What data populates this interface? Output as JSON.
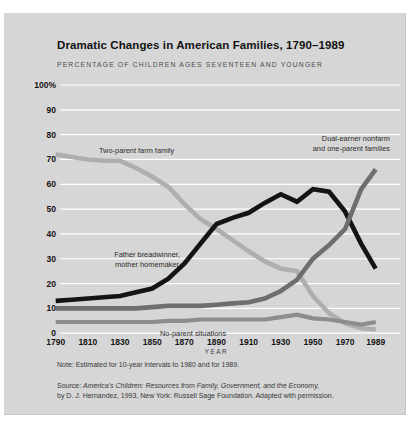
{
  "page": {
    "title": "Dramatic Changes in American Families, 1790–1989",
    "subtitle": "PERCENTAGE OF CHILDREN AGES SEVENTEEN AND YOUNGER",
    "note": "Note: Estimated for 10-year intervals to 1980 and for 1989.",
    "source_prefix": "Source: ",
    "source_italic": "America's Children: Resources from Family, Government, and the Economy,",
    "source_line2": "by D. J. Hernandez, 1993, New York: Russell Sage Foundation. Adapted with permission."
  },
  "colors": {
    "card_background": "#d6d6d6",
    "gridline": "#ffffff",
    "text": "#141414"
  },
  "chart_data": {
    "type": "line",
    "title": "Dramatic Changes in American Families, 1790–1989",
    "subtitle": "PERCENTAGE OF CHILDREN AGES SEVENTEEN AND YOUNGER",
    "xlabel": "YEAR",
    "ylabel": "",
    "ylim": [
      0,
      100
    ],
    "xlim": [
      1790,
      1989
    ],
    "grid": "horizontal-white-every-10",
    "legend_position": "in-plot-annotations",
    "y_tick_labels": [
      "100%",
      "90",
      "80",
      "70",
      "60",
      "50",
      "40",
      "30",
      "20",
      "10",
      "0"
    ],
    "y_tick_values": [
      100,
      90,
      80,
      70,
      60,
      50,
      40,
      30,
      20,
      10,
      0
    ],
    "x_tick_labels": [
      "1790",
      "1810",
      "1830",
      "1850",
      "1870",
      "1890",
      "1910",
      "1930",
      "1950",
      "1970",
      "1989"
    ],
    "x_tick_values": [
      1790,
      1810,
      1830,
      1850,
      1870,
      1890,
      1910,
      1930,
      1950,
      1970,
      1989
    ],
    "x": [
      1790,
      1800,
      1810,
      1820,
      1830,
      1840,
      1850,
      1860,
      1870,
      1880,
      1890,
      1900,
      1910,
      1920,
      1930,
      1940,
      1950,
      1960,
      1970,
      1980,
      1989
    ],
    "series": [
      {
        "name": "Two-parent farm family",
        "color": "#aeaeae",
        "stroke_width": 4.6,
        "values": [
          72,
          71,
          70,
          69.5,
          69.5,
          66.5,
          63,
          59,
          52,
          46,
          42,
          37.5,
          33,
          29,
          26,
          25,
          15,
          8,
          4,
          2,
          1.5
        ]
      },
      {
        "name": "No-parent situations",
        "color": "#8d8d8d",
        "stroke_width": 4.2,
        "values": [
          4.5,
          4.5,
          4.5,
          4.5,
          4.5,
          4.5,
          4.5,
          5,
          5,
          5.5,
          5.5,
          5.5,
          5.5,
          5.5,
          6.5,
          7.5,
          6,
          5.5,
          4.5,
          3.5,
          4.5
        ]
      },
      {
        "name": "Father breadwinner, mother homemaker",
        "color": "#141414",
        "stroke_width": 4.6,
        "values": [
          13,
          13.5,
          14,
          14.5,
          15,
          16.5,
          18,
          22,
          28,
          36,
          44,
          46.5,
          48.5,
          52.5,
          56,
          53,
          58,
          57,
          49,
          36,
          26
        ]
      },
      {
        "name": "Dual-earner nonfarm and one-parent families",
        "color": "#6e6e6e",
        "stroke_width": 4.6,
        "values": [
          10,
          10,
          10,
          10,
          10,
          10,
          10.5,
          11,
          11,
          11,
          11.5,
          12,
          12.5,
          14,
          17,
          21.5,
          30,
          35.5,
          42,
          58,
          66
        ]
      }
    ],
    "annotations": [
      {
        "id": "farm-label",
        "lines": [
          "Two-parent farm family"
        ]
      },
      {
        "id": "dual-label",
        "lines": [
          "Dual-earner nonfarm",
          "and one-parent families"
        ]
      },
      {
        "id": "breadwinner-label",
        "lines": [
          "Father breadwinner,",
          "mother homemaker"
        ]
      },
      {
        "id": "noparent-label",
        "lines": [
          "No-parent situations"
        ]
      }
    ]
  }
}
